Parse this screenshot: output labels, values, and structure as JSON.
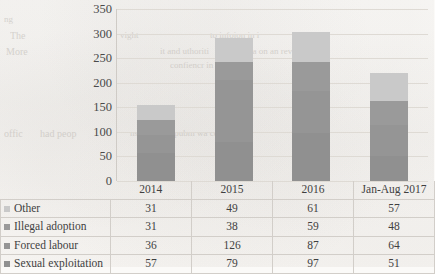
{
  "page": {
    "ghost_text": [
      {
        "t": "ng",
        "x": 4,
        "y": 14,
        "size": 9
      },
      {
        "t": "The",
        "x": 10,
        "y": 30,
        "size": 10
      },
      {
        "t": "More",
        "x": 6,
        "y": 46,
        "size": 10
      },
      {
        "t": "offic",
        "x": 4,
        "y": 128,
        "size": 10
      },
      {
        "t": "had peop",
        "x": 40,
        "y": 128,
        "size": 10
      },
      {
        "t": "vight",
        "x": 120,
        "y": 30,
        "size": 9
      },
      {
        "t": "to infoion in i",
        "x": 210,
        "y": 30,
        "size": 9
      },
      {
        "t": "it and uthoriti",
        "x": 160,
        "y": 46,
        "size": 9
      },
      {
        "t": "sona on an rev",
        "x": 240,
        "y": 46,
        "size": 9
      },
      {
        "t": "confiencr in th",
        "x": 170,
        "y": 60,
        "size": 9
      },
      {
        "t": "nsiding in a pubm wa co ca",
        "x": 130,
        "y": 128,
        "size": 9
      }
    ]
  },
  "chart_data": {
    "type": "bar",
    "stacked": true,
    "title": "",
    "xlabel": "",
    "ylabel": "",
    "ylim": [
      0,
      350
    ],
    "ytick_step": 50,
    "yticks": [
      350,
      300,
      250,
      200,
      150,
      100,
      50,
      0
    ],
    "grid": true,
    "legend_position": "table-left",
    "categories": [
      "2014",
      "2015",
      "2016",
      "Jan-Aug 2017"
    ],
    "series": [
      {
        "name": "Other",
        "values": [
          31,
          49,
          61,
          57
        ],
        "color": "#c9c9c9"
      },
      {
        "name": "Illegal adoption",
        "values": [
          31,
          38,
          59,
          48
        ],
        "color": "#9a9a9a"
      },
      {
        "name": "Forced labour",
        "values": [
          36,
          126,
          87,
          64
        ],
        "color": "#959595"
      },
      {
        "name": "Sexual exploitation",
        "values": [
          57,
          79,
          97,
          51
        ],
        "color": "#909090"
      }
    ],
    "totals": [
      155,
      292,
      304,
      220
    ]
  },
  "table": {
    "corner_label": "",
    "headers": [
      "2014",
      "2015",
      "2016",
      "Jan-Aug 2017"
    ],
    "rows": [
      {
        "label": "Other",
        "values": [
          "31",
          "49",
          "61",
          "57"
        ]
      },
      {
        "label": "Illegal adoption",
        "values": [
          "31",
          "38",
          "59",
          "48"
        ]
      },
      {
        "label": "Forced labour",
        "values": [
          "36",
          "126",
          "87",
          "64"
        ]
      },
      {
        "label": "Sexual exploitation",
        "values": [
          "57",
          "79",
          "97",
          "51"
        ]
      }
    ]
  }
}
